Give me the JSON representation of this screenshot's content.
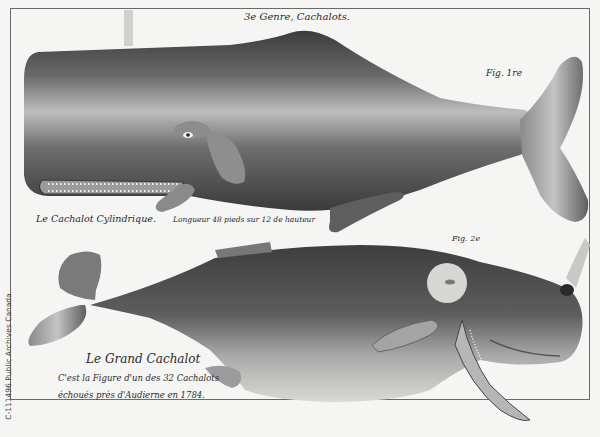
{
  "plate": {
    "heading": "3e Genre, Cachalots.",
    "figures": [
      {
        "label": "Fig. 1re",
        "name": "Le Cachalot Cylindrique.",
        "description": "Longueur 48 pieds sur 12 de hauteur"
      },
      {
        "label": "Fig. 2e",
        "name": "Le Grand Cachalot",
        "description_line1": "C'est la Figure d'un des 32 Cachalots",
        "description_line2": "échoués près d'Audierne en 1784."
      }
    ],
    "credit": "C-111496 Public Archives Canada"
  },
  "colors": {
    "paper": "#f5f5f3",
    "ink_dark": "#3a3a3a",
    "ink_mid": "#6e6e6e",
    "ink_light": "#b8b8b8"
  }
}
